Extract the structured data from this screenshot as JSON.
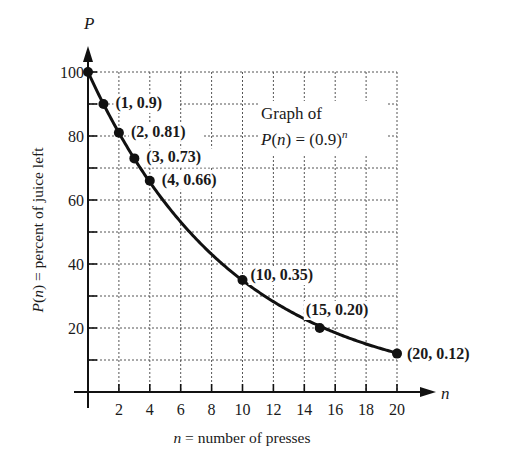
{
  "chart_data": {
    "type": "line",
    "annotation": {
      "line1": "Graph of",
      "line2_prefix": "P",
      "line2_mid": "(",
      "line2_var": "n",
      "line2_suffix": ") = (0.9)",
      "line2_exp": "n"
    },
    "xlabel": {
      "var": "n",
      "text": " = number of presses"
    },
    "ylabel": {
      "var_P": "P",
      "var_n": "n",
      "text": " = percent of juice left"
    },
    "x_axis_var": "n",
    "y_axis_var": "P",
    "xlim": [
      0,
      20
    ],
    "ylim": [
      0,
      100
    ],
    "x_ticks": [
      2,
      4,
      6,
      8,
      10,
      12,
      14,
      16,
      18,
      20
    ],
    "y_ticks_labeled": [
      20,
      40,
      60,
      80,
      100
    ],
    "y_ticks_minor": [
      10,
      30,
      50,
      70,
      90
    ],
    "grid": {
      "on": true,
      "style": "dotted",
      "x_step": 2,
      "y_step": 10
    },
    "function": "P(n) = 100 * 0.9^n",
    "series": [
      {
        "name": "P(n) = (0.9)^n",
        "x": [
          0,
          1,
          2,
          3,
          4,
          10,
          15,
          20
        ],
        "y": [
          100,
          90,
          81,
          73,
          66,
          35,
          20,
          12
        ]
      }
    ],
    "point_labels": [
      {
        "n": 1,
        "text": "(1, 0.9)"
      },
      {
        "n": 2,
        "text": "(2, 0.81)"
      },
      {
        "n": 3,
        "text": "(3, 0.73)"
      },
      {
        "n": 4,
        "text": "(4, 0.66)"
      },
      {
        "n": 10,
        "text": "(10, 0.35)"
      },
      {
        "n": 15,
        "text": "(15, 0.20)"
      },
      {
        "n": 20,
        "text": "(20, 0.12)"
      }
    ],
    "colors": {
      "line": "#111111",
      "grid": "#555555",
      "text": "#1a1a1a",
      "background": "#ffffff"
    }
  }
}
